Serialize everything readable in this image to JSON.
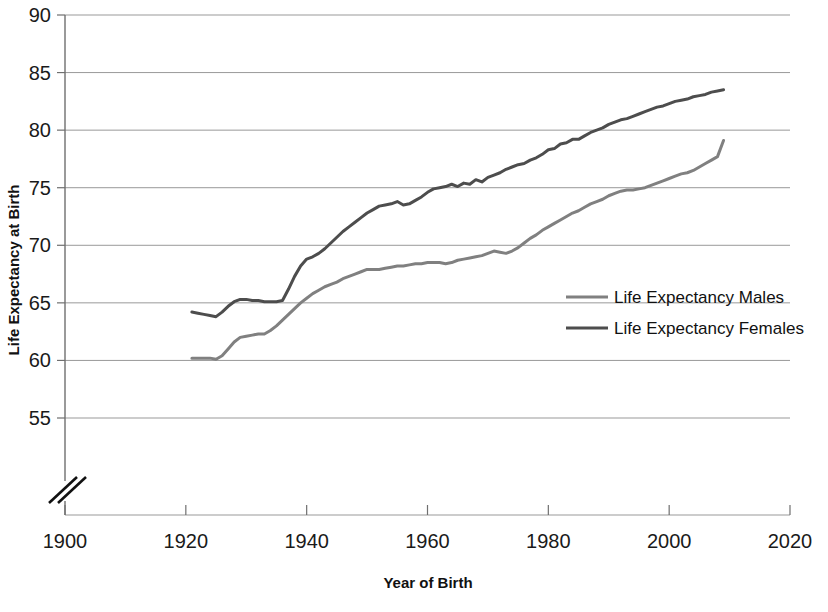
{
  "chart_data": {
    "type": "line",
    "title": "",
    "xlabel": "Year of Birth",
    "ylabel": "Life Expectancy at Birth",
    "xlim": [
      1900,
      2020
    ],
    "ylim": [
      55,
      90
    ],
    "y_axis_break": true,
    "grid": true,
    "legend_position": "center-right",
    "xticks": [
      1900,
      1920,
      1940,
      1960,
      1980,
      2000,
      2020
    ],
    "xtick_labels": [
      "1900",
      "1920",
      "1940",
      "1960",
      "1980",
      "2000",
      "2020"
    ],
    "yticks": [
      55,
      60,
      65,
      70,
      75,
      80,
      85,
      90
    ],
    "ytick_labels": [
      "55",
      "60",
      "65",
      "70",
      "75",
      "80",
      "85",
      "90"
    ],
    "colors": {
      "males": "#808080",
      "females": "#4d4d4d",
      "grid": "#999999",
      "axis": "#6f6f6f"
    },
    "series": [
      {
        "name": "Life Expectancy Males",
        "color": "#808080",
        "x": [
          1921,
          1922,
          1923,
          1924,
          1925,
          1926,
          1927,
          1928,
          1929,
          1930,
          1931,
          1932,
          1933,
          1934,
          1935,
          1936,
          1937,
          1938,
          1939,
          1940,
          1941,
          1942,
          1943,
          1944,
          1945,
          1946,
          1947,
          1948,
          1949,
          1950,
          1951,
          1952,
          1953,
          1954,
          1955,
          1956,
          1957,
          1958,
          1959,
          1960,
          1961,
          1962,
          1963,
          1964,
          1965,
          1966,
          1967,
          1968,
          1969,
          1970,
          1971,
          1972,
          1973,
          1974,
          1975,
          1976,
          1977,
          1978,
          1979,
          1980,
          1981,
          1982,
          1983,
          1984,
          1985,
          1986,
          1987,
          1988,
          1989,
          1990,
          1991,
          1992,
          1993,
          1994,
          1995,
          1996,
          1997,
          1998,
          1999,
          2000,
          2001,
          2002,
          2003,
          2004,
          2005,
          2006,
          2007,
          2008,
          2009
        ],
        "values": [
          60.2,
          60.2,
          60.2,
          60.2,
          60.1,
          60.4,
          61.0,
          61.6,
          62.0,
          62.1,
          62.2,
          62.3,
          62.3,
          62.6,
          63.0,
          63.5,
          64.0,
          64.5,
          65.0,
          65.4,
          65.8,
          66.1,
          66.4,
          66.6,
          66.8,
          67.1,
          67.3,
          67.5,
          67.7,
          67.9,
          67.9,
          67.9,
          68.0,
          68.1,
          68.2,
          68.2,
          68.3,
          68.4,
          68.4,
          68.5,
          68.5,
          68.5,
          68.4,
          68.5,
          68.7,
          68.8,
          68.9,
          69.0,
          69.1,
          69.3,
          69.5,
          69.4,
          69.3,
          69.5,
          69.8,
          70.2,
          70.6,
          70.9,
          71.3,
          71.6,
          71.9,
          72.2,
          72.5,
          72.8,
          73.0,
          73.3,
          73.6,
          73.8,
          74.0,
          74.3,
          74.5,
          74.7,
          74.8,
          74.8,
          74.9,
          75.0,
          75.2,
          75.4,
          75.6,
          75.8,
          76.0,
          76.2,
          76.3,
          76.5,
          76.8,
          77.1,
          77.4,
          77.7,
          79.1
        ]
      },
      {
        "name": "Life Expectancy Females",
        "color": "#4d4d4d",
        "x": [
          1921,
          1922,
          1923,
          1924,
          1925,
          1926,
          1927,
          1928,
          1929,
          1930,
          1931,
          1932,
          1933,
          1934,
          1935,
          1936,
          1937,
          1938,
          1939,
          1940,
          1941,
          1942,
          1943,
          1944,
          1945,
          1946,
          1947,
          1948,
          1949,
          1950,
          1951,
          1952,
          1953,
          1954,
          1955,
          1956,
          1957,
          1958,
          1959,
          1960,
          1961,
          1962,
          1963,
          1964,
          1965,
          1966,
          1967,
          1968,
          1969,
          1970,
          1971,
          1972,
          1973,
          1974,
          1975,
          1976,
          1977,
          1978,
          1979,
          1980,
          1981,
          1982,
          1983,
          1984,
          1985,
          1986,
          1987,
          1988,
          1989,
          1990,
          1991,
          1992,
          1993,
          1994,
          1995,
          1996,
          1997,
          1998,
          1999,
          2000,
          2001,
          2002,
          2003,
          2004,
          2005,
          2006,
          2007,
          2008,
          2009
        ],
        "values": [
          64.2,
          64.1,
          64.0,
          63.9,
          63.8,
          64.2,
          64.7,
          65.1,
          65.3,
          65.3,
          65.2,
          65.2,
          65.1,
          65.1,
          65.1,
          65.2,
          66.2,
          67.3,
          68.2,
          68.8,
          69.0,
          69.3,
          69.7,
          70.2,
          70.7,
          71.2,
          71.6,
          72.0,
          72.4,
          72.8,
          73.1,
          73.4,
          73.5,
          73.6,
          73.8,
          73.5,
          73.6,
          73.9,
          74.2,
          74.6,
          74.9,
          75.0,
          75.1,
          75.3,
          75.1,
          75.4,
          75.3,
          75.7,
          75.5,
          75.9,
          76.1,
          76.3,
          76.6,
          76.8,
          77.0,
          77.1,
          77.4,
          77.6,
          77.9,
          78.3,
          78.4,
          78.8,
          78.9,
          79.2,
          79.2,
          79.5,
          79.8,
          80.0,
          80.2,
          80.5,
          80.7,
          80.9,
          81.0,
          81.2,
          81.4,
          81.6,
          81.8,
          82.0,
          82.1,
          82.3,
          82.5,
          82.6,
          82.7,
          82.9,
          83.0,
          83.1,
          83.3,
          83.4,
          83.5
        ]
      }
    ]
  },
  "legend": {
    "items": [
      {
        "label": "Life Expectancy Males"
      },
      {
        "label": "Life Expectancy Females"
      }
    ]
  }
}
